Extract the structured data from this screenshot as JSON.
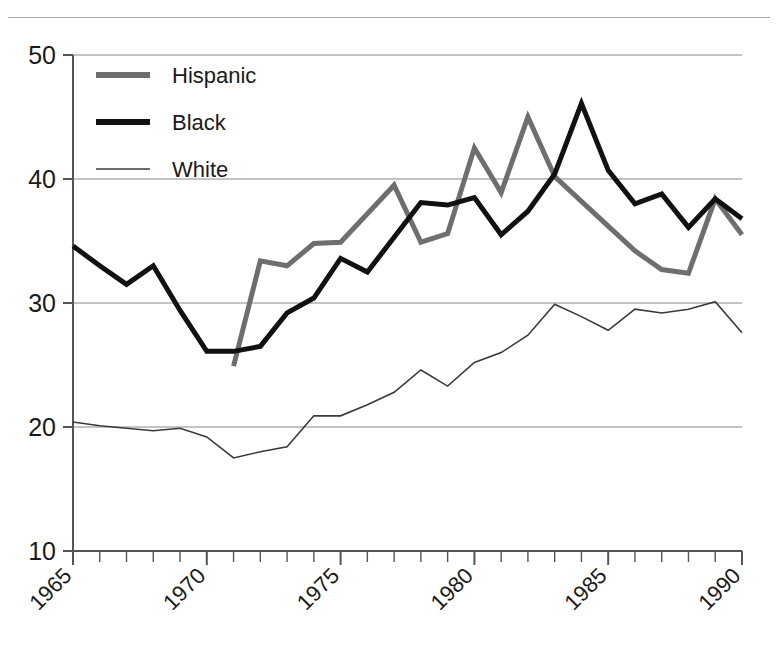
{
  "chart_data": {
    "type": "line",
    "title": "",
    "subtitle": "",
    "xlabel": "",
    "ylabel": "",
    "xlim": [
      1965,
      1990
    ],
    "ylim": [
      10,
      50
    ],
    "yticks": [
      10,
      20,
      30,
      40,
      50
    ],
    "ytick_labels": [
      "10",
      "20",
      "30",
      "40",
      "50"
    ],
    "xticks": [
      1965,
      1970,
      1975,
      1980,
      1985,
      1990
    ],
    "xtick_labels": [
      "1965",
      "1970",
      "1975",
      "1980",
      "1985",
      "1990"
    ],
    "xtick_minor_step": 1,
    "grid": "horizontal",
    "legend_position": "top-left",
    "x": [
      1965,
      1966,
      1967,
      1968,
      1969,
      1970,
      1971,
      1972,
      1973,
      1974,
      1975,
      1976,
      1977,
      1978,
      1979,
      1980,
      1981,
      1982,
      1983,
      1984,
      1985,
      1986,
      1987,
      1988,
      1989,
      1990
    ],
    "series": [
      {
        "name": "Hispanic",
        "color": "#6e6e6e",
        "width": 5,
        "x": [
          1971,
          1972,
          1973,
          1974,
          1975,
          1976,
          1977,
          1978,
          1979,
          1980,
          1981,
          1982,
          1983,
          1984,
          1985,
          1986,
          1987,
          1988,
          1989,
          1990
        ],
        "values": [
          24.9,
          33.4,
          33.0,
          34.8,
          34.9,
          37.2,
          39.5,
          34.9,
          35.6,
          42.5,
          38.9,
          45.0,
          40.2,
          38.2,
          36.2,
          34.2,
          32.7,
          32.4,
          38.4,
          35.5
        ]
      },
      {
        "name": "Black",
        "color": "#111111",
        "width": 5,
        "x": [
          1965,
          1966,
          1967,
          1968,
          1969,
          1970,
          1971,
          1972,
          1973,
          1974,
          1975,
          1976,
          1977,
          1978,
          1979,
          1980,
          1981,
          1982,
          1983,
          1984,
          1985,
          1986,
          1987,
          1988,
          1989,
          1990
        ],
        "values": [
          34.6,
          33.0,
          31.5,
          33.0,
          29.4,
          26.1,
          26.1,
          26.5,
          29.2,
          30.4,
          33.6,
          32.5,
          35.3,
          38.1,
          37.9,
          38.5,
          35.5,
          37.4,
          40.4,
          46.1,
          40.7,
          38.0,
          38.8,
          36.1,
          38.4,
          36.8
        ]
      },
      {
        "name": "White",
        "color": "#3a3a3a",
        "width": 1.6,
        "x": [
          1965,
          1966,
          1967,
          1968,
          1969,
          1970,
          1971,
          1972,
          1973,
          1974,
          1975,
          1976,
          1977,
          1978,
          1979,
          1980,
          1981,
          1982,
          1983,
          1984,
          1985,
          1986,
          1987,
          1988,
          1989,
          1990
        ],
        "values": [
          20.4,
          20.1,
          19.9,
          19.7,
          19.9,
          19.2,
          17.5,
          18.0,
          18.4,
          20.9,
          20.9,
          21.8,
          22.8,
          24.6,
          23.3,
          25.2,
          26.0,
          27.4,
          29.9,
          28.9,
          27.8,
          29.5,
          29.2,
          29.5,
          30.1,
          27.6
        ]
      }
    ],
    "legend": [
      {
        "label": "Hispanic",
        "color": "#6e6e6e",
        "width": 6
      },
      {
        "label": "Black",
        "color": "#111111",
        "width": 6
      },
      {
        "label": "White",
        "color": "#3a3a3a",
        "width": 1.6
      }
    ]
  },
  "axes": {
    "axis_color": "#555555",
    "grid_color": "#8a8a8a"
  }
}
